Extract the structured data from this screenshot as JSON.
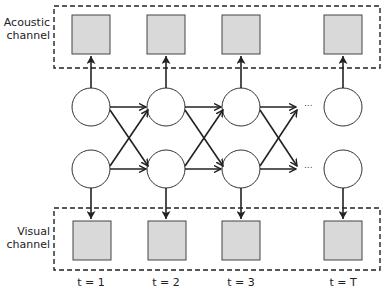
{
  "diagram": {
    "acoustic_label_line1": "Acoustic",
    "acoustic_label_line2": "channel",
    "visual_label_line1": "Visual",
    "visual_label_line2": "channel",
    "ellipsis": "...",
    "time_labels": [
      "t = 1",
      "t = 2",
      "t = 3",
      "t = T"
    ],
    "colors": {
      "observation_fill": "#d9d9d9",
      "stroke": "#222222",
      "background": "#ffffff"
    },
    "nodes": {
      "hidden_states_per_step": 2,
      "observation_channels": [
        "Acoustic",
        "Visual"
      ],
      "time_steps": [
        "1",
        "2",
        "3",
        "T"
      ]
    }
  }
}
